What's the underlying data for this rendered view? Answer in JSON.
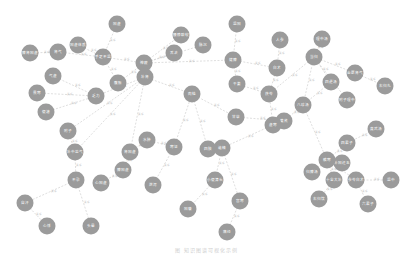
{
  "diagram": {
    "type": "knowledge-graph",
    "node_color": "#9b9b9b",
    "edge_color": "#d6d6d6",
    "node_radius": 8.5,
    "nodes": [
      {
        "id": "n1",
        "label": "阳虚",
        "x": 117,
        "y": 24
      },
      {
        "id": "n2",
        "label": "脾肾阳虚",
        "x": 30,
        "y": 53
      },
      {
        "id": "n3",
        "label": "肾气",
        "x": 58,
        "y": 52
      },
      {
        "id": "n4",
        "label": "阳虚体质",
        "x": 78,
        "y": 45
      },
      {
        "id": "n5",
        "label": "气虚",
        "x": 53,
        "y": 76
      },
      {
        "id": "n6",
        "label": "手足不温",
        "x": 103,
        "y": 57
      },
      {
        "id": "n7",
        "label": "腹胀",
        "x": 118,
        "y": 83
      },
      {
        "id": "n8",
        "label": "畏寒",
        "x": 37,
        "y": 93
      },
      {
        "id": "n9",
        "label": "乏力",
        "x": 96,
        "y": 96
      },
      {
        "id": "n10",
        "label": "便溏",
        "x": 46,
        "y": 112
      },
      {
        "id": "n11",
        "label": "神疲",
        "x": 144,
        "y": 63
      },
      {
        "id": "n12",
        "label": "腰膝酸软",
        "x": 181,
        "y": 35
      },
      {
        "id": "n13",
        "label": "脉沉",
        "x": 203,
        "y": 45
      },
      {
        "id": "n14",
        "label": "舌淡",
        "x": 174,
        "y": 53
      },
      {
        "id": "n15",
        "label": "温阳",
        "x": 237,
        "y": 24
      },
      {
        "id": "n16",
        "label": "健脾",
        "x": 233,
        "y": 60
      },
      {
        "id": "n17",
        "label": "补肾",
        "x": 145,
        "y": 77
      },
      {
        "id": "n18",
        "label": "附子",
        "x": 68,
        "y": 131
      },
      {
        "id": "n19",
        "label": "补中益气",
        "x": 75,
        "y": 152
      },
      {
        "id": "n20",
        "label": "肉桂",
        "x": 192,
        "y": 94
      },
      {
        "id": "n21",
        "label": "干姜",
        "x": 237,
        "y": 84
      },
      {
        "id": "n22",
        "label": "人参",
        "x": 280,
        "y": 40
      },
      {
        "id": "n23",
        "label": "白术",
        "x": 277,
        "y": 68
      },
      {
        "id": "n24",
        "label": "茯苓",
        "x": 269,
        "y": 94
      },
      {
        "id": "n25",
        "label": "甘草",
        "x": 236,
        "y": 117
      },
      {
        "id": "n26",
        "label": "黄芪",
        "x": 284,
        "y": 121
      },
      {
        "id": "n27",
        "label": "当归",
        "x": 314,
        "y": 57
      },
      {
        "id": "n28",
        "label": "理中汤",
        "x": 322,
        "y": 39
      },
      {
        "id": "n29",
        "label": "四逆汤",
        "x": 331,
        "y": 82
      },
      {
        "id": "n30",
        "label": "金匮肾气",
        "x": 355,
        "y": 73
      },
      {
        "id": "n31",
        "label": "右归丸",
        "x": 385,
        "y": 86
      },
      {
        "id": "n32",
        "label": "附子理中",
        "x": 347,
        "y": 100
      },
      {
        "id": "n33",
        "label": "真武汤",
        "x": 376,
        "y": 129
      },
      {
        "id": "n34",
        "label": "四君子",
        "x": 347,
        "y": 143
      },
      {
        "id": "n35",
        "label": "八珍汤",
        "x": 303,
        "y": 105
      },
      {
        "id": "n36",
        "label": "补阳还五",
        "x": 342,
        "y": 163
      },
      {
        "id": "n37",
        "label": "十全大补",
        "x": 334,
        "y": 180
      },
      {
        "id": "n38",
        "label": "右归饮",
        "x": 319,
        "y": 199
      },
      {
        "id": "n39",
        "label": "六君子",
        "x": 368,
        "y": 204
      },
      {
        "id": "n40",
        "label": "参苓白术",
        "x": 356,
        "y": 180
      },
      {
        "id": "n41",
        "label": "归脾汤",
        "x": 312,
        "y": 172
      },
      {
        "id": "n42",
        "label": "温中",
        "x": 391,
        "y": 180
      },
      {
        "id": "n43",
        "label": "散寒",
        "x": 327,
        "y": 160
      },
      {
        "id": "n44",
        "label": "肾阳虚",
        "x": 130,
        "y": 152
      },
      {
        "id": "n45",
        "label": "脾阳虚",
        "x": 123,
        "y": 170
      },
      {
        "id": "n46",
        "label": "心阳虚",
        "x": 101,
        "y": 183
      },
      {
        "id": "n47",
        "label": "水肿",
        "x": 147,
        "y": 140
      },
      {
        "id": "n48",
        "label": "泄泻",
        "x": 153,
        "y": 185
      },
      {
        "id": "n49",
        "label": "四肢",
        "x": 208,
        "y": 149
      },
      {
        "id": "n50",
        "label": "寒证",
        "x": 174,
        "y": 147
      },
      {
        "id": "n51",
        "label": "阳痿",
        "x": 188,
        "y": 209
      },
      {
        "id": "n52",
        "label": "遗精",
        "x": 222,
        "y": 148
      },
      {
        "id": "n53",
        "label": "小便清长",
        "x": 215,
        "y": 180
      },
      {
        "id": "n54",
        "label": "宫寒",
        "x": 240,
        "y": 201
      },
      {
        "id": "n55",
        "label": "痛经",
        "x": 227,
        "y": 232
      },
      {
        "id": "n56",
        "label": "虚寒",
        "x": 273,
        "y": 125
      },
      {
        "id": "n57",
        "label": "不孕",
        "x": 76,
        "y": 180
      },
      {
        "id": "n58",
        "label": "自汗",
        "x": 25,
        "y": 203
      },
      {
        "id": "n59",
        "label": "心悸",
        "x": 47,
        "y": 226
      },
      {
        "id": "n60",
        "label": "头晕",
        "x": 91,
        "y": 226
      }
    ],
    "edges": [
      [
        "n2",
        "n3"
      ],
      [
        "n3",
        "n6"
      ],
      [
        "n4",
        "n6"
      ],
      [
        "n1",
        "n6"
      ],
      [
        "n5",
        "n9"
      ],
      [
        "n8",
        "n9"
      ],
      [
        "n10",
        "n9"
      ],
      [
        "n6",
        "n7"
      ],
      [
        "n7",
        "n11"
      ],
      [
        "n11",
        "n12"
      ],
      [
        "n11",
        "n13"
      ],
      [
        "n11",
        "n14"
      ],
      [
        "n6",
        "n11"
      ],
      [
        "n17",
        "n11"
      ],
      [
        "n17",
        "n20"
      ],
      [
        "n17",
        "n9"
      ],
      [
        "n17",
        "n18"
      ],
      [
        "n17",
        "n19"
      ],
      [
        "n11",
        "n16"
      ],
      [
        "n15",
        "n16"
      ],
      [
        "n16",
        "n21"
      ],
      [
        "n16",
        "n23"
      ],
      [
        "n21",
        "n24"
      ],
      [
        "n22",
        "n23"
      ],
      [
        "n23",
        "n24"
      ],
      [
        "n24",
        "n27"
      ],
      [
        "n27",
        "n28"
      ],
      [
        "n27",
        "n29"
      ],
      [
        "n27",
        "n30"
      ],
      [
        "n27",
        "n32"
      ],
      [
        "n27",
        "n35"
      ],
      [
        "n30",
        "n31"
      ],
      [
        "n29",
        "n35"
      ],
      [
        "n26",
        "n35"
      ],
      [
        "n25",
        "n26"
      ],
      [
        "n20",
        "n25"
      ],
      [
        "n33",
        "n34"
      ],
      [
        "n34",
        "n43"
      ],
      [
        "n43",
        "n36"
      ],
      [
        "n43",
        "n41"
      ],
      [
        "n43",
        "n37"
      ],
      [
        "n43",
        "n40"
      ],
      [
        "n40",
        "n42"
      ],
      [
        "n37",
        "n38"
      ],
      [
        "n39",
        "n40"
      ],
      [
        "n35",
        "n43"
      ],
      [
        "n44",
        "n47"
      ],
      [
        "n44",
        "n45"
      ],
      [
        "n45",
        "n46"
      ],
      [
        "n47",
        "n50"
      ],
      [
        "n50",
        "n20"
      ],
      [
        "n50",
        "n48"
      ],
      [
        "n49",
        "n52"
      ],
      [
        "n20",
        "n49"
      ],
      [
        "n52",
        "n53"
      ],
      [
        "n53",
        "n51"
      ],
      [
        "n52",
        "n54"
      ],
      [
        "n54",
        "n55"
      ],
      [
        "n56",
        "n52"
      ],
      [
        "n56",
        "n24"
      ],
      [
        "n18",
        "n19"
      ],
      [
        "n19",
        "n57"
      ],
      [
        "n57",
        "n58"
      ],
      [
        "n58",
        "n59"
      ],
      [
        "n57",
        "n60"
      ],
      [
        "n44",
        "n17"
      ]
    ],
    "edge_label": "关系"
  },
  "caption": "图 知识图谱可视化示例"
}
